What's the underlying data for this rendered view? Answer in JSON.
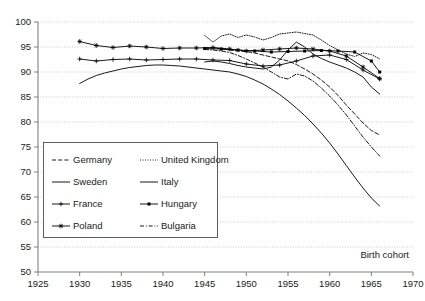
{
  "chart_data": {
    "type": "line",
    "title": "",
    "xlabel": "Birth cohort",
    "ylabel": "",
    "xlim": [
      1925,
      1970
    ],
    "ylim": [
      50,
      100
    ],
    "xticks": [
      1925,
      1930,
      1935,
      1940,
      1945,
      1950,
      1955,
      1960,
      1965,
      1970
    ],
    "yticks": [
      50,
      55,
      60,
      65,
      70,
      75,
      80,
      85,
      90,
      95,
      100
    ],
    "grid": "horizontal-dotted",
    "legend_position": "lower-left-inside",
    "series": [
      {
        "name": "Germany",
        "style": "dashed",
        "marker": "none",
        "x": [
          1945,
          1946,
          1947,
          1948,
          1949,
          1950,
          1951,
          1952,
          1953,
          1954,
          1955,
          1956,
          1957,
          1958,
          1959,
          1960,
          1961,
          1962,
          1963,
          1964,
          1965,
          1966
        ],
        "y": [
          94.8,
          94.9,
          94.6,
          94.4,
          94.2,
          94.1,
          93.8,
          93.4,
          93.0,
          92.6,
          92.2,
          91.5,
          90.6,
          89.6,
          88.4,
          87.0,
          85.3,
          83.4,
          81.6,
          79.8,
          78.3,
          77.4
        ]
      },
      {
        "name": "United Kingdom",
        "style": "dotted",
        "marker": "none",
        "x": [
          1945,
          1946,
          1947,
          1948,
          1949,
          1950,
          1951,
          1952,
          1953,
          1954,
          1955,
          1956,
          1957,
          1958,
          1959,
          1960,
          1961,
          1962,
          1963,
          1964,
          1965,
          1966
        ],
        "y": [
          97.3,
          96.0,
          97.2,
          97.6,
          96.9,
          97.4,
          97.0,
          96.4,
          96.9,
          97.6,
          97.8,
          98.0,
          97.7,
          97.4,
          96.4,
          95.3,
          94.4,
          93.6,
          93.1,
          93.8,
          93.5,
          92.6
        ]
      },
      {
        "name": "Sweden",
        "style": "solid",
        "marker": "none",
        "x": [
          1930,
          1931,
          1932,
          1933,
          1934,
          1935,
          1936,
          1937,
          1938,
          1939,
          1940,
          1941,
          1942,
          1943,
          1944,
          1945,
          1946,
          1947,
          1948,
          1949,
          1950,
          1951,
          1952,
          1953,
          1954,
          1955,
          1956,
          1957,
          1958,
          1959,
          1960,
          1961,
          1962,
          1963,
          1964,
          1965,
          1966
        ],
        "y": [
          87.7,
          88.6,
          89.3,
          89.8,
          90.2,
          90.6,
          90.9,
          91.1,
          91.3,
          91.4,
          91.4,
          91.3,
          91.2,
          91.0,
          90.8,
          90.6,
          90.4,
          90.2,
          90.0,
          89.6,
          89.1,
          88.4,
          87.6,
          86.6,
          85.5,
          84.2,
          82.8,
          81.3,
          79.6,
          77.8,
          75.8,
          73.6,
          71.3,
          69.0,
          66.8,
          64.8,
          63.2
        ]
      },
      {
        "name": "Italy",
        "style": "solid-bold",
        "marker": "none",
        "x": [
          1945,
          1946,
          1947,
          1948,
          1949,
          1950,
          1951,
          1952,
          1953,
          1954,
          1955,
          1956,
          1957,
          1958,
          1959,
          1960,
          1961,
          1962,
          1963,
          1964,
          1965,
          1966
        ],
        "y": [
          92.0,
          92.2,
          92.0,
          91.7,
          91.3,
          91.0,
          90.8,
          90.6,
          91.0,
          92.4,
          94.4,
          96.0,
          95.0,
          93.6,
          92.7,
          92.0,
          91.4,
          90.8,
          90.0,
          89.0,
          87.0,
          85.6
        ]
      },
      {
        "name": "France",
        "style": "solid-thin-marker",
        "marker": "plus",
        "x": [
          1930,
          1932,
          1934,
          1936,
          1938,
          1940,
          1942,
          1944,
          1946,
          1948,
          1950,
          1952,
          1954,
          1956,
          1958,
          1960,
          1962,
          1964,
          1966
        ],
        "y": [
          92.6,
          92.2,
          92.5,
          92.6,
          92.4,
          92.5,
          92.6,
          92.6,
          92.4,
          92.3,
          91.6,
          91.2,
          91.4,
          92.2,
          93.2,
          93.4,
          92.5,
          90.4,
          88.6
        ]
      },
      {
        "name": "Hungary",
        "style": "solid-marker",
        "marker": "square",
        "x": [
          1945,
          1947,
          1949,
          1951,
          1953,
          1955,
          1957,
          1959,
          1961,
          1963,
          1965,
          1966
        ],
        "y": [
          94.7,
          94.6,
          94.4,
          94.2,
          94.0,
          94.1,
          94.2,
          94.3,
          94.2,
          94.0,
          92.2,
          90.0
        ]
      },
      {
        "name": "Poland",
        "style": "solid-marker",
        "marker": "star",
        "x": [
          1930,
          1932,
          1934,
          1936,
          1938,
          1940,
          1942,
          1944,
          1946,
          1948,
          1950,
          1952,
          1954,
          1956,
          1958,
          1960,
          1962,
          1964,
          1966
        ],
        "y": [
          96.1,
          95.3,
          94.9,
          95.2,
          95.0,
          94.7,
          94.8,
          94.8,
          94.9,
          94.6,
          94.2,
          94.4,
          94.6,
          94.8,
          94.6,
          94.2,
          93.2,
          91.0,
          88.7
        ]
      },
      {
        "name": "Bulgaria",
        "style": "dash-dot",
        "marker": "none",
        "x": [
          1945,
          1946,
          1947,
          1948,
          1949,
          1950,
          1951,
          1952,
          1953,
          1954,
          1955,
          1956,
          1957,
          1958,
          1959,
          1960,
          1961,
          1962,
          1963,
          1964,
          1965,
          1966
        ],
        "y": [
          94.5,
          94.4,
          94.2,
          93.9,
          93.3,
          92.6,
          91.8,
          91.0,
          90.0,
          89.0,
          88.6,
          89.6,
          89.2,
          88.2,
          86.8,
          85.2,
          83.4,
          81.4,
          79.2,
          77.0,
          75.0,
          73.2
        ]
      }
    ]
  },
  "legend": {
    "entries": [
      {
        "label": "Germany"
      },
      {
        "label": "United Kingdom"
      },
      {
        "label": "Sweden"
      },
      {
        "label": "Italy"
      },
      {
        "label": "France"
      },
      {
        "label": "Hungary"
      },
      {
        "label": "Poland"
      },
      {
        "label": "Bulgaria"
      }
    ]
  }
}
